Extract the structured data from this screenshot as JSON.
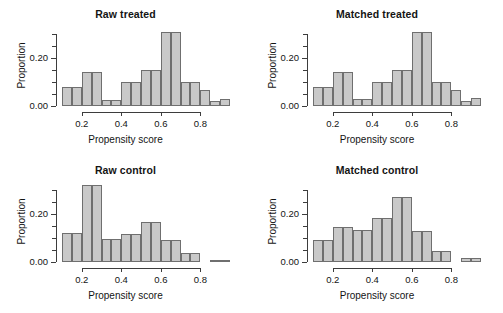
{
  "figure": {
    "background": "#ffffff",
    "bar_fill": "#c9c9c9",
    "bar_border": "#6f6f6f",
    "axis_color": "#3d3d3d",
    "caption_fragment": ""
  },
  "axes": {
    "xlabel": "Propensity score",
    "ylabel": "Proportion",
    "x_ticks": [
      "0.2",
      "0.4",
      "0.6",
      "0.8"
    ],
    "x_tick_values": [
      0.2,
      0.4,
      0.6,
      0.8
    ],
    "y_ticks": [
      "0.00",
      "0.20"
    ],
    "y_tick_values": [
      0.0,
      0.2
    ],
    "y_minor_values": [
      0.05,
      0.1,
      0.15,
      0.25,
      0.3
    ],
    "xlim": [
      0.1,
      0.95
    ],
    "ylim": [
      0.0,
      0.325
    ]
  },
  "chart_data": [
    {
      "type": "bar",
      "id": "raw-treated",
      "title": "Raw treated",
      "xlabel": "Propensity score",
      "ylabel": "Proportion",
      "xlim": [
        0.1,
        0.95
      ],
      "ylim": [
        0.0,
        0.325
      ],
      "grid": false,
      "legend": "none",
      "bin_width": 0.05,
      "bin_edges": [
        0.1,
        0.15,
        0.2,
        0.25,
        0.3,
        0.35,
        0.4,
        0.45,
        0.5,
        0.55,
        0.6,
        0.65,
        0.7,
        0.75,
        0.8,
        0.85,
        0.9,
        0.95
      ],
      "categories": [
        "0.10-0.15",
        "0.15-0.20",
        "0.20-0.25",
        "0.25-0.30",
        "0.30-0.35",
        "0.35-0.40",
        "0.40-0.45",
        "0.45-0.50",
        "0.50-0.55",
        "0.55-0.60",
        "0.60-0.65",
        "0.65-0.70",
        "0.70-0.75",
        "0.75-0.80",
        "0.80-0.85",
        "0.85-0.90",
        "0.90-0.95"
      ],
      "values": [
        0.08,
        0.08,
        0.14,
        0.14,
        0.025,
        0.025,
        0.1,
        0.1,
        0.15,
        0.15,
        0.31,
        0.31,
        0.1,
        0.1,
        0.065,
        0.02,
        0.03
      ]
    },
    {
      "type": "bar",
      "id": "matched-treated",
      "title": "Matched treated",
      "xlabel": "Propensity score",
      "ylabel": "Proportion",
      "xlim": [
        0.1,
        0.95
      ],
      "ylim": [
        0.0,
        0.325
      ],
      "grid": false,
      "legend": "none",
      "bin_width": 0.05,
      "bin_edges": [
        0.1,
        0.15,
        0.2,
        0.25,
        0.3,
        0.35,
        0.4,
        0.45,
        0.5,
        0.55,
        0.6,
        0.65,
        0.7,
        0.75,
        0.8,
        0.85,
        0.9,
        0.95
      ],
      "categories": [
        "0.10-0.15",
        "0.15-0.20",
        "0.20-0.25",
        "0.25-0.30",
        "0.30-0.35",
        "0.35-0.40",
        "0.40-0.45",
        "0.45-0.50",
        "0.50-0.55",
        "0.55-0.60",
        "0.60-0.65",
        "0.65-0.70",
        "0.70-0.75",
        "0.75-0.80",
        "0.80-0.85",
        "0.85-0.90",
        "0.90-0.95"
      ],
      "values": [
        0.08,
        0.08,
        0.14,
        0.14,
        0.028,
        0.028,
        0.1,
        0.1,
        0.15,
        0.15,
        0.31,
        0.31,
        0.1,
        0.1,
        0.065,
        0.02,
        0.032
      ]
    },
    {
      "type": "bar",
      "id": "raw-control",
      "title": "Raw control",
      "xlabel": "Propensity score",
      "ylabel": "Proportion",
      "xlim": [
        0.1,
        0.95
      ],
      "ylim": [
        0.0,
        0.325
      ],
      "grid": false,
      "legend": "none",
      "bin_width": 0.05,
      "bin_edges": [
        0.1,
        0.15,
        0.2,
        0.25,
        0.3,
        0.35,
        0.4,
        0.45,
        0.5,
        0.55,
        0.6,
        0.65,
        0.7,
        0.75,
        0.8,
        0.85,
        0.9,
        0.95
      ],
      "categories": [
        "0.10-0.15",
        "0.15-0.20",
        "0.20-0.25",
        "0.25-0.30",
        "0.30-0.35",
        "0.35-0.40",
        "0.40-0.45",
        "0.45-0.50",
        "0.50-0.55",
        "0.55-0.60",
        "0.60-0.65",
        "0.65-0.70",
        "0.70-0.75",
        "0.75-0.80",
        "0.80-0.85",
        "0.85-0.90",
        "0.90-0.95"
      ],
      "values": [
        0.12,
        0.12,
        0.32,
        0.32,
        0.095,
        0.095,
        0.115,
        0.115,
        0.165,
        0.165,
        0.09,
        0.09,
        0.038,
        0.038,
        0.0,
        0.008,
        0.008
      ]
    },
    {
      "type": "bar",
      "id": "matched-control",
      "title": "Matched control",
      "xlabel": "Propensity score",
      "ylabel": "Proportion",
      "xlim": [
        0.1,
        0.95
      ],
      "ylim": [
        0.0,
        0.325
      ],
      "grid": false,
      "legend": "none",
      "bin_width": 0.05,
      "bin_edges": [
        0.1,
        0.15,
        0.2,
        0.25,
        0.3,
        0.35,
        0.4,
        0.45,
        0.5,
        0.55,
        0.6,
        0.65,
        0.7,
        0.75,
        0.8,
        0.85,
        0.9,
        0.95
      ],
      "categories": [
        "0.10-0.15",
        "0.15-0.20",
        "0.20-0.25",
        "0.25-0.30",
        "0.30-0.35",
        "0.35-0.40",
        "0.40-0.45",
        "0.45-0.50",
        "0.50-0.55",
        "0.55-0.60",
        "0.60-0.65",
        "0.65-0.70",
        "0.70-0.75",
        "0.75-0.80",
        "0.80-0.85",
        "0.85-0.90",
        "0.90-0.95"
      ],
      "values": [
        0.09,
        0.09,
        0.145,
        0.145,
        0.135,
        0.135,
        0.185,
        0.185,
        0.27,
        0.27,
        0.13,
        0.13,
        0.045,
        0.045,
        0.0,
        0.018,
        0.018
      ]
    }
  ]
}
